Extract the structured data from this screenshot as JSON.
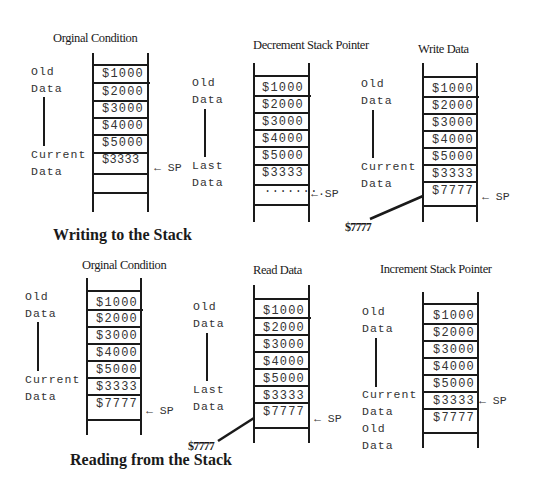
{
  "writing": {
    "section_title": "Writing to the Stack",
    "panels": [
      {
        "title": "Orginal Condition",
        "side_top": [
          "Old",
          "Data"
        ],
        "side_bottom": [
          "Current",
          "Data"
        ],
        "cells": [
          "$1000",
          "$2000",
          "$3000",
          "$4000",
          "$5000",
          "$3333",
          ""
        ],
        "sp_label": "← SP",
        "sp_row": 5
      },
      {
        "title": "Decrement Stack Pointer",
        "side_top": [
          "Old",
          "Data"
        ],
        "side_bottom": [
          "Last",
          "Data"
        ],
        "cells": [
          "$1000",
          "$2000",
          "$3000",
          "$4000",
          "$5000",
          "$3333",
          "·······"
        ],
        "sp_label": "←·SP",
        "sp_row": 6
      },
      {
        "title": "Write Data",
        "side_top": [
          "Old",
          "Data"
        ],
        "side_bottom": [
          "Current",
          "Data"
        ],
        "cells": [
          "$1000",
          "$2000",
          "$3000",
          "$4000",
          "$5000",
          "$3333",
          "$7777"
        ],
        "sp_label": "← SP",
        "sp_row": 6,
        "incoming_value": "$7777"
      }
    ]
  },
  "reading": {
    "section_title": "Reading from the Stack",
    "panels": [
      {
        "title": "Orginal Condition",
        "side_top": [
          "Old",
          "Data"
        ],
        "side_bottom": [
          "Current",
          "Data"
        ],
        "cells": [
          "$1000",
          "$2000",
          "$3000",
          "$4000",
          "$5000",
          "$3333",
          "$7777"
        ],
        "sp_label": "← SP",
        "sp_row": 6
      },
      {
        "title": "Read Data",
        "side_top": [
          "Old",
          "Data"
        ],
        "side_bottom": [
          "Last",
          "Data"
        ],
        "cells": [
          "$1000",
          "$2000",
          "$3000",
          "$4000",
          "$5000",
          "$3333",
          "$7777"
        ],
        "sp_label": "← SP",
        "sp_row": 6,
        "outgoing_value": "$7777"
      },
      {
        "title": "Increment Stack Pointer",
        "side_top": [
          "Old",
          "Data"
        ],
        "side_bottom": [
          "Current",
          "Data",
          "Old",
          "Data"
        ],
        "cells": [
          "$1000",
          "$2000",
          "$3000",
          "$4000",
          "$5000",
          "$3333",
          "$7777"
        ],
        "sp_label": "← SP",
        "sp_row": 5
      }
    ]
  }
}
